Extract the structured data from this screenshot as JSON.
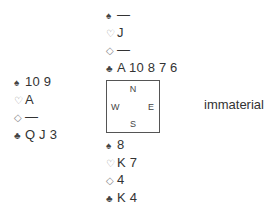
{
  "suits": {
    "spades": "♠",
    "hearts": "♡",
    "diamonds": "◇",
    "clubs": "♣"
  },
  "north": {
    "spades": "—",
    "hearts": "J",
    "diamonds": "—",
    "clubs": "A 10 8 7 6"
  },
  "west": {
    "spades": "10 9",
    "hearts": "A",
    "diamonds": "—",
    "clubs": "Q J 3"
  },
  "east": {
    "text": "immaterial"
  },
  "south": {
    "spades": "8",
    "hearts": "K 7",
    "diamonds": "4",
    "clubs": "K 4"
  },
  "compass": {
    "n": "N",
    "w": "W",
    "e": "E",
    "s": "S"
  }
}
